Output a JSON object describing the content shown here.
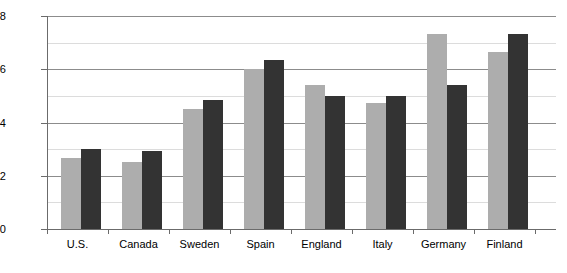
{
  "chart_data": {
    "type": "bar",
    "title": "",
    "subtitle": "",
    "xlabel": "",
    "ylabel": "",
    "ylim": [
      10,
      58
    ],
    "yticks": [
      10,
      22,
      34,
      46,
      58
    ],
    "minor_yticks": [
      16,
      28,
      40,
      52
    ],
    "grid": true,
    "legend_position": "none",
    "categories": [
      "U.S.",
      "Canada",
      "Sweden",
      "Spain",
      "England",
      "Italy",
      "Germany",
      "Finland"
    ],
    "series": [
      {
        "name": "Series 1",
        "color": "#adadad",
        "values": [
          26,
          25,
          37,
          46,
          42.5,
          38.5,
          54,
          50
        ]
      },
      {
        "name": "Series 2",
        "color": "#333333",
        "values": [
          28,
          27.5,
          39,
          48,
          40,
          40,
          42.5,
          54
        ]
      }
    ]
  },
  "axis": {
    "y_axis_color": "#6b6b6b",
    "x_axis_color": "#6b6b6b",
    "major_gridline_color": "#8c8c8c",
    "minor_gridline_color": "#dcdcdc"
  }
}
